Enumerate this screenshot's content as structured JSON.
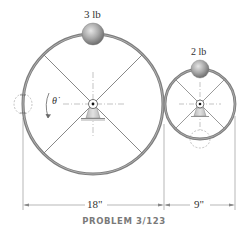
{
  "figure": {
    "caption": "PROBLEM 3/123",
    "large_wheel": {
      "mass_label": "3 lb",
      "diameter_label": "18\"",
      "angular_rate_symbol": "θ̇"
    },
    "small_wheel": {
      "mass_label": "2 lb",
      "diameter_label": "9\""
    },
    "colors": {
      "rim": "#7d7d7d",
      "rim_highlight": "#bdbdbd",
      "spokes": "#555555",
      "centerline": "#9a9a9a",
      "ball": "#a8a8a8",
      "support": "#c8c8c8",
      "caption": "#7a7a7a"
    }
  }
}
